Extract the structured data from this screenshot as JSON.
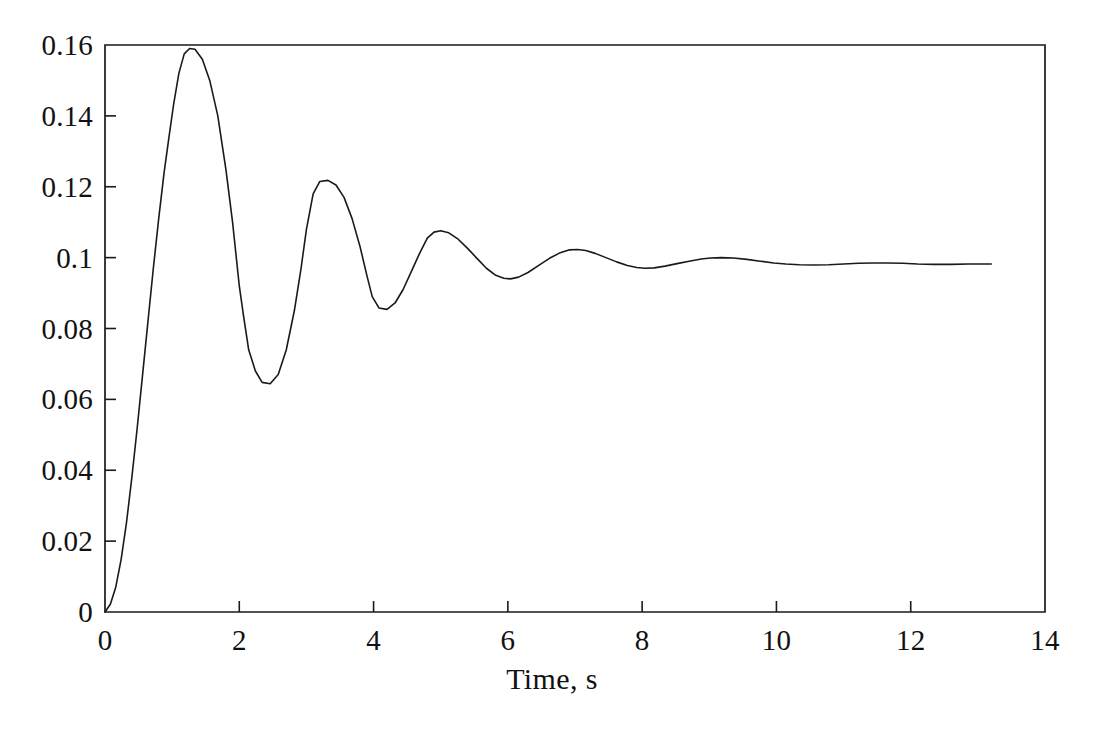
{
  "chart_data": {
    "type": "line",
    "title": "",
    "subtitle": "",
    "xlabel": "Time, s",
    "ylabel": "",
    "xlim": [
      0,
      14
    ],
    "ylim": [
      0,
      0.16
    ],
    "grid": false,
    "legend": null,
    "xticks": [
      0,
      2,
      4,
      6,
      8,
      10,
      12,
      14
    ],
    "xtick_labels": [
      "0",
      "2",
      "4",
      "6",
      "8",
      "10",
      "12",
      "14"
    ],
    "yticks": [
      0,
      0.02,
      0.04,
      0.06,
      0.08,
      0.1,
      0.12,
      0.14,
      0.16
    ],
    "ytick_labels": [
      "0",
      "0.02",
      "0.04",
      "0.06",
      "0.08",
      "0.1",
      "0.12",
      "0.14",
      "0.16"
    ],
    "line_color": "#1a1a1a",
    "line_width": 1.6,
    "background_color": "#ffffff",
    "annotations": [],
    "series": [
      {
        "name": "step response",
        "steady_state": 0.098,
        "x": [
          0.0,
          0.08,
          0.16,
          0.24,
          0.32,
          0.4,
          0.48,
          0.56,
          0.64,
          0.72,
          0.8,
          0.88,
          0.96,
          1.02,
          1.1,
          1.18,
          1.26,
          1.34,
          1.45,
          1.56,
          1.68,
          1.8,
          1.9,
          2.0,
          2.06,
          2.14,
          2.24,
          2.34,
          2.46,
          2.58,
          2.7,
          2.82,
          2.92,
          3.0,
          3.1,
          3.2,
          3.32,
          3.44,
          3.56,
          3.68,
          3.8,
          3.9,
          3.98,
          4.08,
          4.2,
          4.32,
          4.44,
          4.56,
          4.68,
          4.8,
          4.9,
          5.0,
          5.12,
          5.26,
          5.4,
          5.54,
          5.68,
          5.82,
          5.94,
          6.04,
          6.16,
          6.3,
          6.46,
          6.62,
          6.78,
          6.92,
          7.04,
          7.16,
          7.3,
          7.46,
          7.62,
          7.78,
          7.92,
          8.04,
          8.18,
          8.34,
          8.52,
          8.7,
          8.88,
          9.02,
          9.18,
          9.36,
          9.56,
          9.76,
          9.96,
          10.14,
          10.34,
          10.56,
          10.78,
          11.0,
          11.22,
          11.44,
          11.66,
          11.88,
          12.1,
          12.34,
          12.6,
          12.86,
          13.05,
          13.2
        ],
        "y": [
          0.0,
          0.0022,
          0.007,
          0.0148,
          0.0252,
          0.038,
          0.052,
          0.067,
          0.082,
          0.097,
          0.111,
          0.124,
          0.135,
          0.143,
          0.152,
          0.1575,
          0.159,
          0.1588,
          0.156,
          0.15,
          0.14,
          0.125,
          0.11,
          0.092,
          0.084,
          0.074,
          0.068,
          0.0648,
          0.0644,
          0.067,
          0.074,
          0.085,
          0.097,
          0.108,
          0.118,
          0.1215,
          0.1218,
          0.1205,
          0.117,
          0.111,
          0.103,
          0.095,
          0.089,
          0.0858,
          0.0854,
          0.0872,
          0.091,
          0.096,
          0.101,
          0.1055,
          0.1072,
          0.1076,
          0.107,
          0.1052,
          0.1026,
          0.0998,
          0.097,
          0.095,
          0.0942,
          0.094,
          0.0945,
          0.0958,
          0.0978,
          0.0998,
          0.1014,
          0.1022,
          0.1023,
          0.102,
          0.1012,
          0.1,
          0.0988,
          0.0978,
          0.0972,
          0.097,
          0.0971,
          0.0976,
          0.0983,
          0.099,
          0.0996,
          0.0999,
          0.1,
          0.0999,
          0.0995,
          0.099,
          0.0985,
          0.0982,
          0.098,
          0.0979,
          0.098,
          0.0982,
          0.0984,
          0.0985,
          0.0985,
          0.0984,
          0.0982,
          0.0981,
          0.0981,
          0.0982,
          0.0982,
          0.0982
        ]
      }
    ],
    "axes_geometry": {
      "left_px": 105,
      "right_px": 1045,
      "top_px": 45,
      "bottom_px": 612
    }
  }
}
